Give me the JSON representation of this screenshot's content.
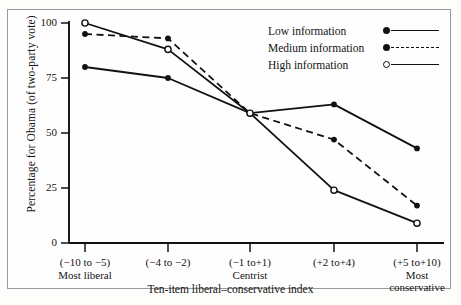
{
  "chart_data": {
    "type": "line",
    "title": "",
    "xlabel": "Ten-item liberal–conservative index",
    "ylabel": "Percentage for Obama (of two-party vote)",
    "categories": [
      "(−10 to −5)",
      "(−4 to −2)",
      "(−1 to+1)",
      "(+2 to+4)",
      "(+5 to+10)"
    ],
    "category_sublabels": [
      "Most liberal",
      "",
      "Centrist",
      "",
      "Most\nconservative"
    ],
    "ylim": [
      0,
      100
    ],
    "yticks": [
      0,
      25,
      50,
      75,
      100
    ],
    "ytick_labels": [
      "0",
      "25",
      "50",
      "75",
      "100"
    ],
    "grid": false,
    "legend_position": "top-right",
    "series": [
      {
        "name": "Low information",
        "marker": "filled-circle",
        "linestyle": "solid",
        "values": [
          80,
          75,
          59,
          63,
          43
        ]
      },
      {
        "name": "Medium information",
        "marker": "filled-circle",
        "linestyle": "dashed",
        "values": [
          95,
          93,
          59,
          47,
          17
        ]
      },
      {
        "name": "High information",
        "marker": "open-circle",
        "linestyle": "solid",
        "values": [
          100,
          88,
          59,
          24,
          9
        ]
      }
    ]
  },
  "axis": {
    "y_tick_labels": [
      "100",
      "75",
      "50",
      "25",
      "0"
    ],
    "x_tick_labels": [
      {
        "range": "(−10 to −5)",
        "sub1": "Most liberal",
        "sub2": ""
      },
      {
        "range": "(−4 to −2)",
        "sub1": "",
        "sub2": ""
      },
      {
        "range": "(−1 to+1)",
        "sub1": "Centrist",
        "sub2": ""
      },
      {
        "range": "(+2 to+4)",
        "sub1": "",
        "sub2": ""
      },
      {
        "range": "(+5 to+10)",
        "sub1": "Most",
        "sub2": "conservative"
      }
    ],
    "x_title": "Ten-item liberal–conservative index",
    "y_title": "Percentage for Obama (of two-party vote)"
  },
  "legend": {
    "items": [
      {
        "label": "Low information"
      },
      {
        "label": "Medium information"
      },
      {
        "label": "High information"
      }
    ]
  },
  "colors": {
    "ink": "#111111",
    "frame": "#9a9a9a",
    "paper": "#fefefe"
  }
}
